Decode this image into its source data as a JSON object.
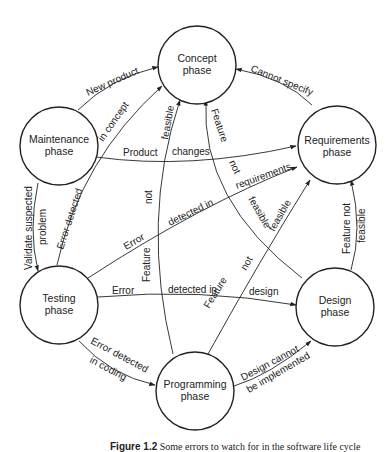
{
  "nodes": {
    "concept": {
      "line1": "Concept",
      "line2": "phase"
    },
    "requirements": {
      "line1": "Requirements",
      "line2": "phase"
    },
    "design": {
      "line1": "Design",
      "line2": "phase"
    },
    "programming": {
      "line1": "Programming",
      "line2": "phase"
    },
    "testing": {
      "line1": "Testing",
      "line2": "phase"
    },
    "maintenance": {
      "line1": "Maintenance",
      "line2": "phase"
    }
  },
  "edges": {
    "new_product": "New product",
    "cannot_specify": "Cannot specify",
    "error_in_concept_a": "Error detected",
    "error_in_concept_b": "in concept",
    "product_changes_a": "Product",
    "product_changes_b": "changes",
    "validate_a": "Validate suspected",
    "validate_b": "problem",
    "error_req_a": "Error",
    "error_req_b": "detected in",
    "error_req_c": "requirements",
    "error_design_a": "Error",
    "error_design_b": "detected in",
    "error_design_c": "design",
    "error_coding_a": "Error detected",
    "error_coding_b": "in coding",
    "design_cannot_a": "Design cannot",
    "design_cannot_b": "be implemented",
    "feat_prog_concept_a": "Feature",
    "feat_prog_concept_b": "not",
    "feat_prog_concept_c": "feasible",
    "feat_design_concept_a": "Feature",
    "feat_design_concept_b": "not",
    "feat_design_concept_c": "feasible",
    "feat_prog_req_a": "Feature",
    "feat_prog_req_b": "not",
    "feat_prog_req_c": "feasible",
    "feat_design_req_a": "Feature not",
    "feat_design_req_b": "feasible"
  },
  "caption": {
    "label": "Figure 1.2",
    "text": "Some errors to watch for in the software life cycle"
  }
}
